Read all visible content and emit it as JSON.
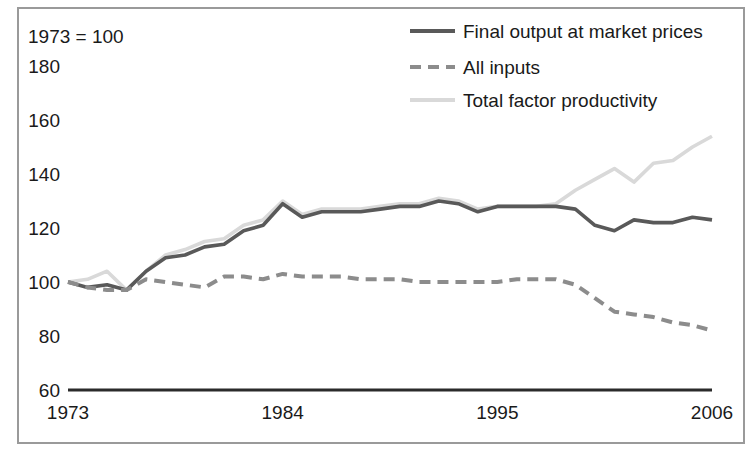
{
  "note": "1973 = 100",
  "axes": {
    "y_ticks": [
      "180",
      "160",
      "140",
      "120",
      "100",
      "80",
      "60"
    ],
    "x_ticks": [
      "1973",
      "1984",
      "1995",
      "2006"
    ]
  },
  "legend": {
    "items": [
      {
        "label": "Final output at market prices",
        "style": "solid",
        "color": "#595959"
      },
      {
        "label": "All inputs",
        "style": "dashed",
        "color": "#8c8c8c"
      },
      {
        "label": "Total factor productivity",
        "style": "solid",
        "color": "#d9d9d9"
      }
    ]
  },
  "chart_data": {
    "type": "line",
    "title": "",
    "subtitle": "1973 = 100",
    "xlabel": "",
    "ylabel": "",
    "xlim": [
      1973,
      2006
    ],
    "ylim": [
      60,
      180
    ],
    "grid": false,
    "legend_position": "top-right",
    "x": [
      1973,
      1974,
      1975,
      1976,
      1977,
      1978,
      1979,
      1980,
      1981,
      1982,
      1983,
      1984,
      1985,
      1986,
      1987,
      1988,
      1989,
      1990,
      1991,
      1992,
      1993,
      1994,
      1995,
      1996,
      1997,
      1998,
      1999,
      2000,
      2001,
      2002,
      2003,
      2004,
      2005,
      2006
    ],
    "series": [
      {
        "name": "Final output at market prices",
        "color": "#595959",
        "style": "solid",
        "values": [
          100,
          98,
          99,
          97,
          104,
          109,
          110,
          113,
          114,
          119,
          121,
          129,
          124,
          126,
          126,
          126,
          127,
          128,
          128,
          130,
          129,
          126,
          128,
          128,
          128,
          128,
          127,
          121,
          119,
          123,
          122,
          122,
          124,
          123
        ]
      },
      {
        "name": "All inputs",
        "color": "#8c8c8c",
        "style": "dashed",
        "values": [
          100,
          98,
          97,
          97,
          101,
          100,
          99,
          98,
          102,
          102,
          101,
          103,
          102,
          102,
          102,
          101,
          101,
          101,
          100,
          100,
          100,
          100,
          100,
          101,
          101,
          101,
          99,
          94,
          89,
          88,
          87,
          85,
          84,
          82
        ]
      },
      {
        "name": "Total factor productivity",
        "color": "#d9d9d9",
        "style": "solid",
        "values": [
          100,
          101,
          104,
          97,
          104,
          110,
          112,
          115,
          116,
          121,
          123,
          130,
          125,
          127,
          127,
          127,
          128,
          129,
          129,
          131,
          130,
          127,
          128,
          128,
          128,
          129,
          134,
          138,
          142,
          137,
          144,
          145,
          150,
          154
        ]
      }
    ]
  }
}
